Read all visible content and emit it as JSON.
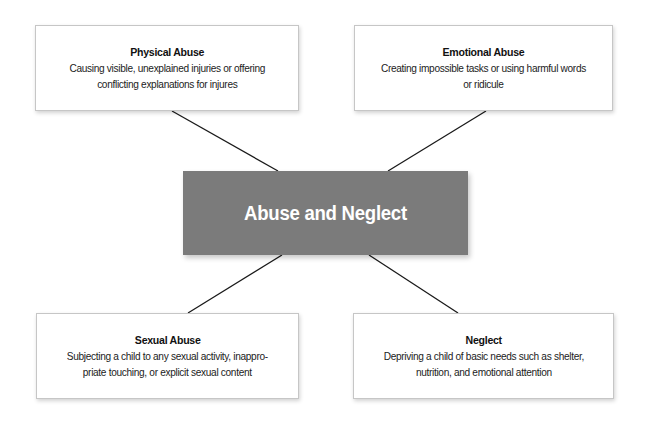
{
  "diagram": {
    "type": "hub-and-spoke",
    "center": {
      "label": "Abuse and Neglect",
      "fill_color": "#7b7b7b",
      "text_color": "#ffffff"
    },
    "nodes": [
      {
        "id": "physical",
        "title": "Physical Abuse",
        "description": "Causing visible, unexplained injuries or offering conflicting explanations for injures",
        "position": "top-left"
      },
      {
        "id": "emotional",
        "title": "Emotional Abuse",
        "description": "Creating impossible tasks or using harmful words or ridicule",
        "position": "top-right"
      },
      {
        "id": "sexual",
        "title": "Sexual Abuse",
        "description": "Subjecting a child to any sexual activity, inappro-priate touching, or explicit sexual content",
        "position": "bottom-left"
      },
      {
        "id": "neglect",
        "title": "Neglect",
        "description": "Depriving a child of basic needs such as shelter, nutrition, and emotional attention",
        "position": "bottom-right"
      }
    ],
    "connector_color": "#1a1a1a",
    "box_border_color": "#c6c6c6"
  }
}
